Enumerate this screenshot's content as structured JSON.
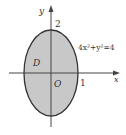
{
  "diagram": {
    "type": "ellipse-region",
    "equation_label": "4x²+y²=4",
    "region_label": "D",
    "origin_label": "O",
    "x_axis_label": "x",
    "y_axis_label": "y",
    "x_intercept_label": "1",
    "y_intercept_label": "2",
    "colors": {
      "fill": "#c8c8c8",
      "stroke": "#333333",
      "axis": "#444444",
      "background": "#ffffff"
    }
  }
}
